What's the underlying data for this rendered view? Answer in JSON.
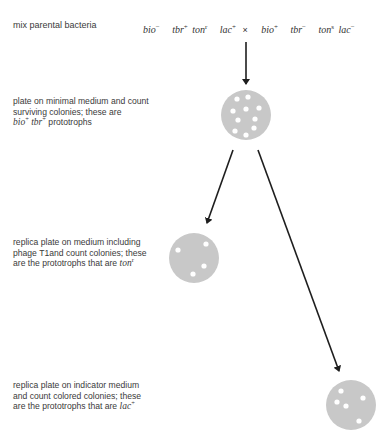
{
  "steps": [
    {
      "id": "mix",
      "text": "mix parental bacteria"
    },
    {
      "id": "minimal-plate",
      "lines": [
        "plate on minimal medium and count",
        "surviving colonies; these are"
      ],
      "genotype_line": {
        "g1": "bio",
        "g1_sup": "+",
        "g2": "tbr",
        "g2_sup": "+",
        "suffix": " prototrophs"
      },
      "colonies": 10
    },
    {
      "id": "phage-plate",
      "lines": [
        "replica plate on medium including",
        "phage T1and count colonies; these"
      ],
      "last_line": "are the prototrophs that are ",
      "genotype": "ton",
      "genotype_sup": "r",
      "colonies": 4
    },
    {
      "id": "indicator-plate",
      "lines": [
        "replica plate on indicator medium",
        "and count colored colonies; these"
      ],
      "last_line": "are the prototrophs that are ",
      "genotype": "lac",
      "genotype_sup": "+",
      "colonies": 5
    }
  ],
  "cross": {
    "parent1": [
      {
        "gene": "bio",
        "allele": "−"
      },
      {
        "gene": "tbr",
        "allele": "+"
      },
      {
        "gene": "ton",
        "allele": "r"
      },
      {
        "gene": "lac",
        "allele": "+"
      }
    ],
    "operator": "×",
    "parent2": [
      {
        "gene": "bio",
        "allele": "+"
      },
      {
        "gene": "tbr",
        "allele": "−"
      },
      {
        "gene": "ton",
        "allele": "s"
      },
      {
        "gene": "lac",
        "allele": "−"
      }
    ]
  },
  "colors": {
    "plate": "#c8c8c8",
    "colony": "#ffffff",
    "arrow": "#1e1e1e",
    "text": "#3a3a3a"
  }
}
